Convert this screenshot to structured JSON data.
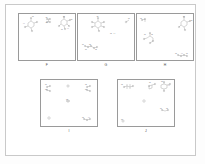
{
  "figure": {
    "type": "multi-panel-chemical-structure-figure",
    "background_color": "#ffffff",
    "frame_color": "#c9c9c9",
    "panel_border_color": "#9a9a9a",
    "structure_color": "#7a7a7a",
    "panel_count": 5
  },
  "panels": [
    {
      "id": "F",
      "label": "F",
      "row": 1,
      "structures": [
        {
          "name": "cluster-1",
          "x": 8,
          "y": 6,
          "atoms": 9,
          "annotation": "C"
        },
        {
          "name": "cluster-2",
          "x": 28,
          "y": 4,
          "atoms": 6,
          "annotation": "N"
        },
        {
          "name": "cluster-3",
          "x": 42,
          "y": 4,
          "atoms": 12,
          "annotation": "O"
        }
      ],
      "text_labels": [
        {
          "text": "H",
          "x": 5,
          "y": 9
        },
        {
          "text": "N",
          "x": 14,
          "y": 4
        },
        {
          "text": "O",
          "x": 27,
          "y": 3
        },
        {
          "text": "O",
          "x": 27,
          "y": 9
        },
        {
          "text": "N",
          "x": 44,
          "y": 3
        },
        {
          "text": "O",
          "x": 50,
          "y": 5
        },
        {
          "text": "N",
          "x": 43,
          "y": 11
        },
        {
          "text": "H",
          "x": 48,
          "y": 13
        }
      ]
    },
    {
      "id": "G",
      "label": "G",
      "row": 1,
      "structures": [
        {
          "name": "cluster-1",
          "x": 16,
          "y": 5,
          "atoms": 14,
          "annotation": "N"
        },
        {
          "name": "cluster-2",
          "x": 49,
          "y": 5,
          "atoms": 3,
          "annotation": "O"
        },
        {
          "name": "cluster-3",
          "x": 6,
          "y": 30,
          "atoms": 10,
          "annotation": "N"
        }
      ],
      "text_labels": [
        {
          "text": "O",
          "x": 19,
          "y": 2
        },
        {
          "text": "N",
          "x": 49,
          "y": 4
        },
        {
          "text": "O",
          "x": 33,
          "y": 18
        },
        {
          "text": "H",
          "x": 36,
          "y": 18
        },
        {
          "text": "N",
          "x": 4,
          "y": 30
        },
        {
          "text": "O",
          "x": 11,
          "y": 30
        },
        {
          "text": "N",
          "x": 8,
          "y": 34
        },
        {
          "text": "O",
          "x": 17,
          "y": 34
        }
      ]
    },
    {
      "id": "H",
      "label": "H",
      "row": 1,
      "structures": [
        {
          "name": "cluster-1",
          "x": 4,
          "y": 4,
          "atoms": 4,
          "annotation": "O"
        },
        {
          "name": "cluster-2",
          "x": 43,
          "y": 4,
          "atoms": 11,
          "annotation": "N"
        },
        {
          "name": "cluster-3",
          "x": 8,
          "y": 20,
          "atoms": 9,
          "annotation": "O"
        }
      ],
      "text_labels": [
        {
          "text": "O",
          "x": 4,
          "y": 4
        },
        {
          "text": "N",
          "x": 46,
          "y": 3
        },
        {
          "text": "O",
          "x": 52,
          "y": 6
        },
        {
          "text": "N",
          "x": 8,
          "y": 22
        },
        {
          "text": "O",
          "x": 14,
          "y": 22
        },
        {
          "text": "O",
          "x": 40,
          "y": 40
        },
        {
          "text": "H",
          "x": 45,
          "y": 40
        },
        {
          "text": "N",
          "x": 50,
          "y": 40
        }
      ]
    },
    {
      "id": "I",
      "label": "I",
      "row": 2,
      "structures": [
        {
          "name": "cluster-1",
          "x": 5,
          "y": 5,
          "atoms": 7,
          "annotation": "N"
        },
        {
          "name": "cluster-2",
          "x": 26,
          "y": 4,
          "atoms": 2,
          "annotation": "O"
        },
        {
          "name": "cluster-3",
          "x": 45,
          "y": 5,
          "atoms": 8,
          "annotation": "O"
        },
        {
          "name": "cluster-4",
          "x": 26,
          "y": 20,
          "atoms": 4,
          "annotation": "N"
        },
        {
          "name": "cluster-5",
          "x": 6,
          "y": 37,
          "atoms": 3,
          "annotation": "O"
        },
        {
          "name": "cluster-6",
          "x": 42,
          "y": 38,
          "atoms": 5,
          "annotation": "N"
        }
      ],
      "text_labels": [
        {
          "text": "N",
          "x": 5,
          "y": 4
        },
        {
          "text": "O",
          "x": 5,
          "y": 9
        },
        {
          "text": "O",
          "x": 45,
          "y": 4
        },
        {
          "text": "N",
          "x": 45,
          "y": 9
        },
        {
          "text": "O",
          "x": 26,
          "y": 20
        },
        {
          "text": "O",
          "x": 43,
          "y": 38
        },
        {
          "text": "H",
          "x": 48,
          "y": 38
        }
      ]
    },
    {
      "id": "J",
      "label": "J",
      "row": 2,
      "structures": [
        {
          "name": "cluster-1",
          "x": 5,
          "y": 4,
          "atoms": 8,
          "annotation": "O"
        },
        {
          "name": "cluster-2",
          "x": 30,
          "y": 3,
          "atoms": 9,
          "annotation": "N"
        },
        {
          "name": "cluster-3",
          "x": 42,
          "y": 3,
          "atoms": 10,
          "annotation": "O"
        },
        {
          "name": "cluster-4",
          "x": 25,
          "y": 20,
          "atoms": 2,
          "annotation": "N"
        },
        {
          "name": "cluster-5",
          "x": 43,
          "y": 29,
          "atoms": 4,
          "annotation": "O"
        },
        {
          "name": "cluster-6",
          "x": 4,
          "y": 40,
          "atoms": 2,
          "annotation": "N"
        }
      ],
      "text_labels": [
        {
          "text": "O",
          "x": 4,
          "y": 5
        },
        {
          "text": "N",
          "x": 32,
          "y": 3
        },
        {
          "text": "O",
          "x": 44,
          "y": 3
        },
        {
          "text": "H",
          "x": 49,
          "y": 6
        },
        {
          "text": "N",
          "x": 44,
          "y": 30
        },
        {
          "text": "O",
          "x": 48,
          "y": 30
        },
        {
          "text": "N",
          "x": 4,
          "y": 41
        }
      ]
    }
  ]
}
